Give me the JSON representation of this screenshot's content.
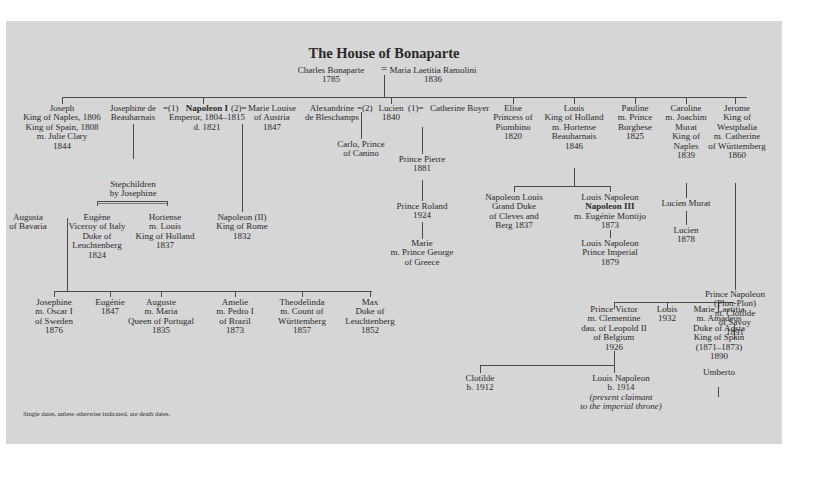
{
  "title": "The House of Bonaparte",
  "footnote": "Single dates, unless otherwise indicated, are death dates.",
  "root": {
    "father": [
      "Charles Bonaparte",
      "1785"
    ],
    "marriage_symbol": "=",
    "mother": [
      "Maria Laetitia Ramolini",
      "1836"
    ]
  },
  "generation1": {
    "joseph": [
      "Joseph",
      "King of Naples, 1806",
      "King of Spain, 1808",
      "m. Julie Clary",
      "1844"
    ],
    "josephine": [
      "Josephine de",
      "Beauharnais"
    ],
    "josephine_marriage": "=(1)",
    "napoleon_name": "Napoleon I",
    "napoleon_detail": [
      "Emperor, 1804–1815",
      "d. 1821"
    ],
    "marie_louise_marriage": "(2)=",
    "marie_louise": [
      "Marie Louise",
      "of Austria",
      "1847"
    ],
    "alexandrine": [
      "Alexandrine",
      "de Bleschamps"
    ],
    "alexandrine_marriage": "=(2)",
    "lucien": [
      "Lucien",
      "1840"
    ],
    "catherine_marriage": "(1)=",
    "catherine": [
      "Catherine Boyer"
    ],
    "elise": [
      "Elise",
      "Princess of",
      "Piombino",
      "1820"
    ],
    "louis": [
      "Louis",
      "King of Holland",
      "m. Hortense",
      "Beauharnais",
      "1846"
    ],
    "pauline": [
      "Pauline",
      "m. Prince",
      "Borghese",
      "1825"
    ],
    "caroline": [
      "Caroline",
      "m. Joachim",
      "Murat",
      "King of",
      "Naples",
      "1839"
    ],
    "jerome": [
      "Jerome",
      "King of",
      "Westphalia",
      "m. Catherine",
      "of Württemberg",
      "1860"
    ]
  },
  "stepchildren": {
    "label": [
      "Stepchildren",
      "by Josephine"
    ],
    "eugene": [
      "Eugène",
      "Viceroy of Italy",
      "Duke of",
      "Leuchtenberg",
      "1824"
    ],
    "hortense": [
      "Hortense",
      "m. Louis",
      "King of Holland",
      "1837"
    ],
    "augusta": [
      "Augusta",
      "of Bavaria"
    ]
  },
  "napoleon_ii": [
    "Napoleon (II)",
    "King of Rome",
    "1832"
  ],
  "lucien_line": {
    "carlo": [
      "Carlo, Prince",
      "of Canino"
    ],
    "pierre": [
      "Prince Pierre",
      "1881"
    ],
    "roland": [
      "Prince Roland",
      "1924"
    ],
    "marie": [
      "Marie",
      "m. Prince George",
      "of Greece"
    ]
  },
  "louis_line": {
    "napoleon_louis": [
      "Napoleon Louis",
      "Grand Duke",
      "of Cleves and",
      "Berg 1837"
    ],
    "louis_napoleon_name": "Louis Napoleon",
    "napoleon_iii": "Napoleon III",
    "louis_napoleon_detail": [
      "m. Eugénie Montijo",
      "1873"
    ],
    "prince_imperial": [
      "Louis Napoleon",
      "Prince Imperial",
      "1879"
    ]
  },
  "murat_line": {
    "lucien_murat": [
      "Lucien Murat"
    ],
    "lucien": [
      "Lucien",
      "1878"
    ]
  },
  "jerome_line": {
    "prince_napoleon": [
      "Prince Napoleon",
      "(Plon-Plon)",
      "m. Clotilde",
      "of Savoy",
      "1891"
    ],
    "prince_victor": [
      "Prince Victor",
      "m. Clementine",
      "dau. of Leopold II",
      "of Belgium",
      "1926"
    ],
    "louis": [
      "Louis",
      "1932"
    ],
    "marie_laetitia": [
      "Marie Laetitia",
      "m. Amadeus",
      "Duke of Aosta",
      "King of Spain",
      "(1871–1873)",
      "1890"
    ],
    "umberto": [
      "Umberto"
    ],
    "clotilde": [
      "Clotilde",
      "b. 1912"
    ],
    "louis_napoleon": [
      "Louis Napoleon",
      "b. 1914"
    ],
    "claimant_note": [
      "(present claimant",
      "to the imperial throne)"
    ]
  },
  "eugene_children": {
    "josephine": [
      "Josephine",
      "m. Oscar I",
      "of Sweden",
      "1876"
    ],
    "eugenie": [
      "Eugénie",
      "1847"
    ],
    "auguste": [
      "Auguste",
      "m. Maria",
      "Queen of Portugal",
      "1835"
    ],
    "amelie": [
      "Amelie",
      "m. Pedro I",
      "of Brazil",
      "1873"
    ],
    "theodelinda": [
      "Theodelinda",
      "m. Count of",
      "Württemberg",
      "1857"
    ],
    "max": [
      "Max",
      "Duke of",
      "Leuchtenberg",
      "1852"
    ]
  }
}
